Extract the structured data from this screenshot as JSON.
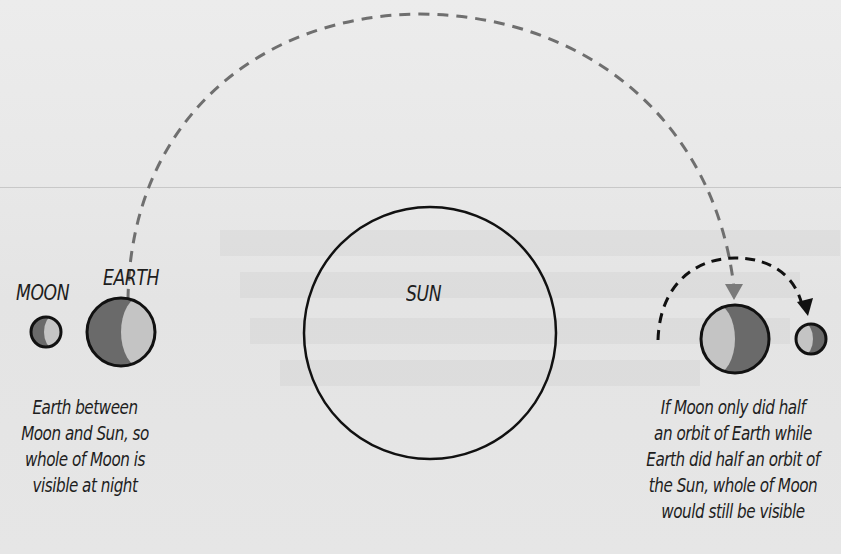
{
  "diagram": {
    "labels": {
      "moon": "MOON",
      "earth": "EARTH",
      "sun": "SUN"
    },
    "captions": {
      "left": [
        "Earth between",
        "Moon and Sun, so",
        "whole of Moon is",
        "visible at night"
      ],
      "right": [
        "If Moon only did half",
        "an orbit of Earth while",
        "Earth did half an orbit of",
        "the Sun, whole of Moon",
        "would still be visible"
      ]
    },
    "colors": {
      "background": "#e9e9e9",
      "outline": "#111111",
      "dark_shade": "#6a6a6a",
      "light_shade": "#c4c4c4",
      "earth_path": "#6f6f6f",
      "moon_path": "#111111"
    }
  }
}
